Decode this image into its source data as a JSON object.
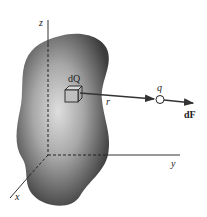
{
  "figure": {
    "labels": {
      "z_axis": "z",
      "y_axis": "y",
      "x_axis": "x",
      "charge_element": "dQ",
      "distance": "r",
      "point_charge": "q",
      "force": "dF"
    },
    "colors": {
      "body_dark": "#3a3a3a",
      "body_light": "#d8d8d8",
      "lines": "#333333",
      "background": "#ffffff"
    }
  }
}
